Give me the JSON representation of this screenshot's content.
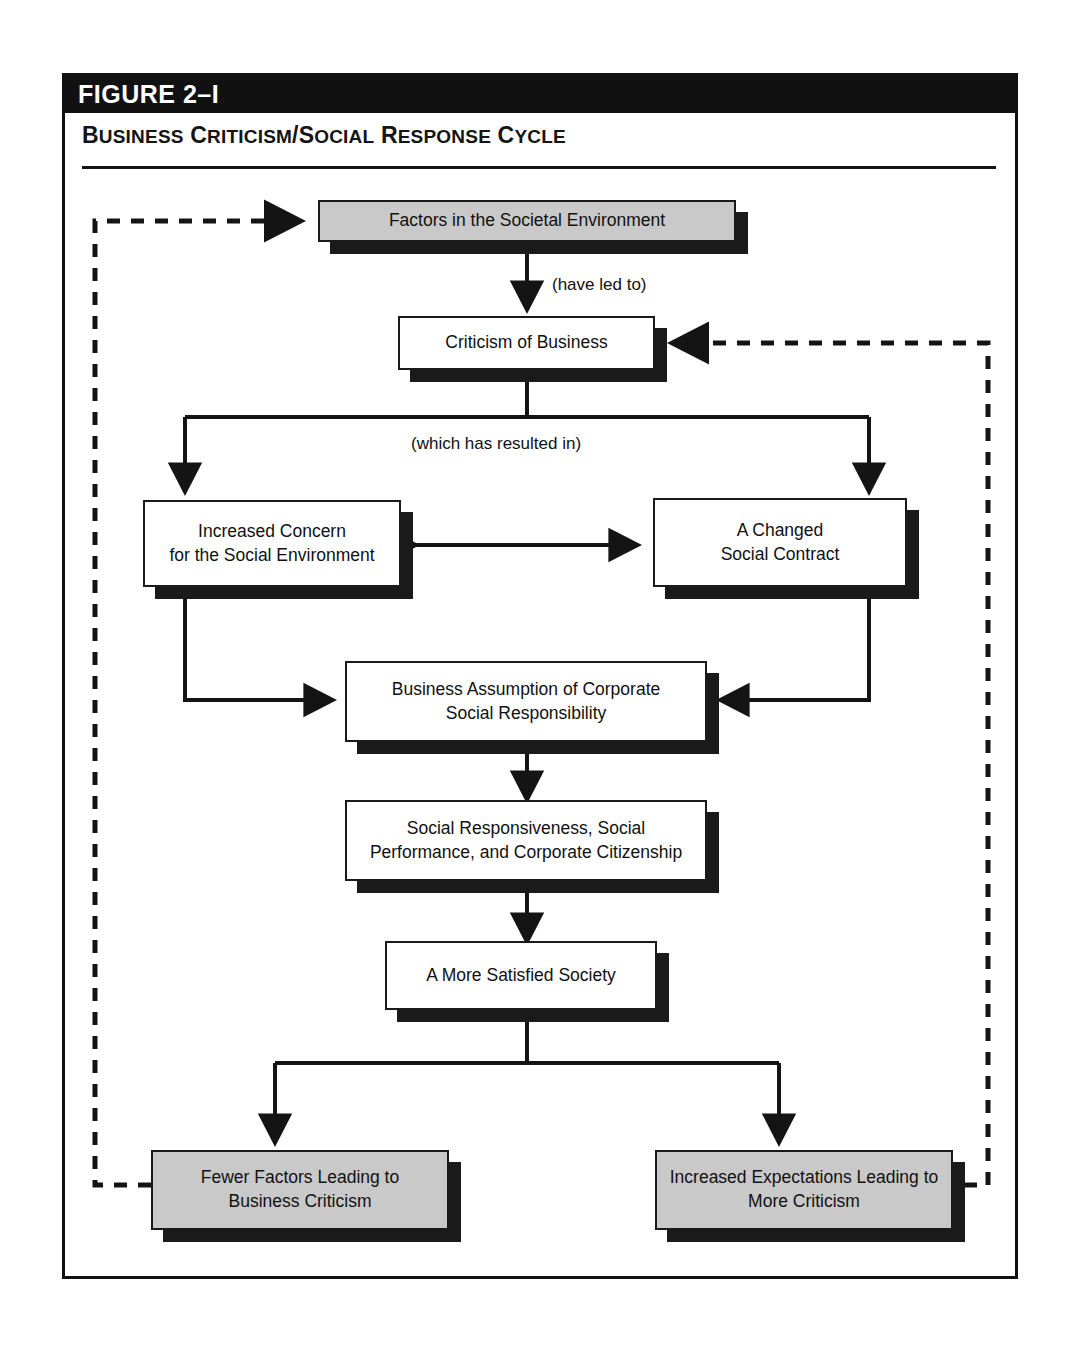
{
  "figure": {
    "number": "FIGURE 2–I",
    "title": "Business Criticism/Social Response Cycle"
  },
  "nodes": {
    "factors": "Factors in the Societal Environment",
    "criticism": "Criticism of Business",
    "increased_concern_line1": "Increased Concern",
    "increased_concern_line2": "for the Social Environment",
    "changed_contract_line1": "A Changed",
    "changed_contract_line2": "Social Contract",
    "csr_line1": "Business Assumption of Corporate",
    "csr_line2": "Social Responsibility",
    "responsiveness_line1": "Social Responsiveness, Social",
    "responsiveness_line2": "Performance, and Corporate Citizenship",
    "satisfied": "A More Satisfied Society",
    "fewer_factors_line1": "Fewer Factors Leading to",
    "fewer_factors_line2": "Business Criticism",
    "increased_expectations_line1": "Increased Expectations Leading to",
    "increased_expectations_line2": "More Criticism"
  },
  "edge_labels": {
    "have_led_to": "(have led to)",
    "which_has_resulted_in": "(which has resulted in)"
  },
  "colors": {
    "ink": "#111111",
    "shaded_box_fill": "#c9c9c9",
    "header_bar": "#111111",
    "page_background": "#ffffff"
  }
}
